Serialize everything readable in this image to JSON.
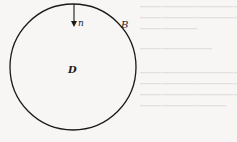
{
  "figure": {
    "region_label": "D",
    "boundary_label": "B",
    "normal_label": "n",
    "circle": {
      "cx": 73,
      "cy": 67,
      "r": 63,
      "stroke": "#1a1a1a"
    },
    "arrow": {
      "x": 74,
      "y1": 4,
      "y2": 26
    }
  },
  "background_text": {
    "note": "faint show-through text from reverse side of page (illegible)",
    "lines": [
      "",
      "",
      "",
      "",
      "",
      "",
      "",
      ""
    ]
  }
}
